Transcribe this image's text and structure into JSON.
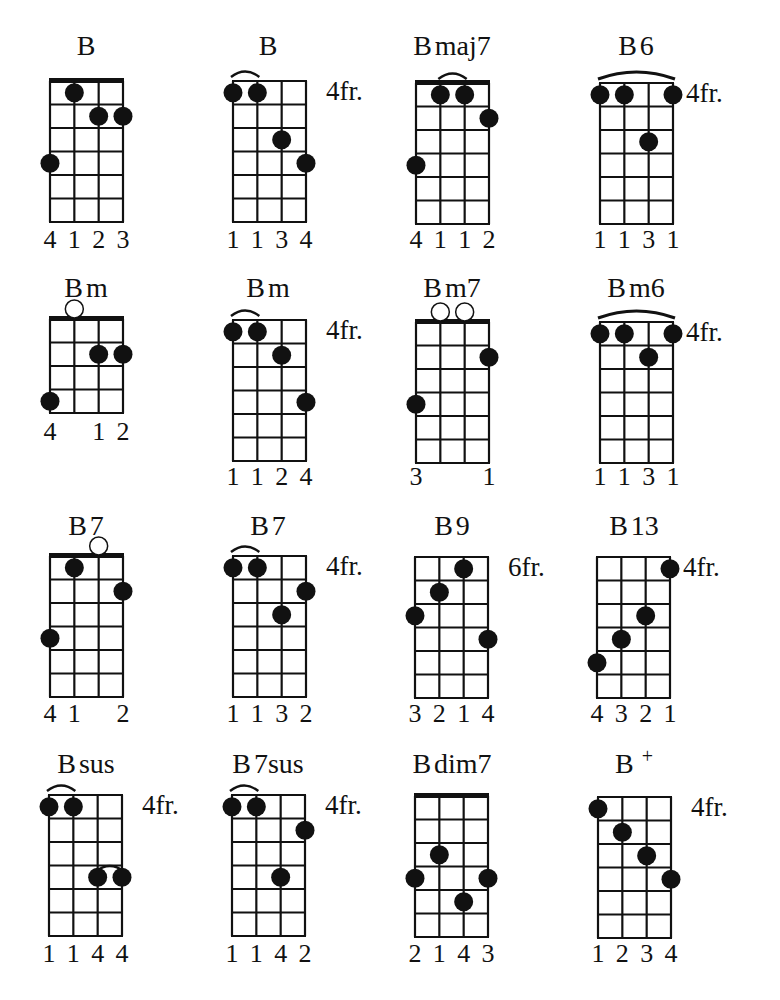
{
  "page": {
    "root": "B"
  },
  "style": {
    "ink": "#111111",
    "paper": "#ffffff"
  },
  "chords": [
    {
      "name": "B",
      "x": 50,
      "y": 81,
      "frets": 6,
      "nut": true,
      "position": "",
      "title_x": 86,
      "title_y": 55,
      "dots": [
        [
          1,
          1
        ],
        [
          2,
          2
        ],
        [
          3,
          2
        ],
        [
          0,
          4
        ]
      ],
      "open": [],
      "arcs": [],
      "fingers": [
        "4",
        "1",
        "2",
        "3"
      ],
      "fingers_y": 248
    },
    {
      "name": "B",
      "x": 233,
      "y": 81,
      "frets": 6,
      "nut": false,
      "position": "4fr.",
      "title_x": 268,
      "title_y": 55,
      "dots": [
        [
          0,
          1
        ],
        [
          1,
          1
        ],
        [
          2,
          3
        ],
        [
          3,
          4
        ]
      ],
      "open": [],
      "arcs": [
        [
          0,
          1
        ]
      ],
      "fingers": [
        "1",
        "1",
        "3",
        "4"
      ],
      "fingers_y": 248
    },
    {
      "name": "B maj7",
      "x": 416,
      "y": 83,
      "frets": 6,
      "nut": true,
      "position": "",
      "title_x": 452,
      "title_y": 55,
      "dots": [
        [
          1,
          1
        ],
        [
          2,
          1
        ],
        [
          3,
          2
        ],
        [
          0,
          4
        ]
      ],
      "open": [],
      "arcs": [
        [
          1,
          2
        ]
      ],
      "fingers": [
        "4",
        "1",
        "1",
        "2"
      ],
      "fingers_y": 248
    },
    {
      "name": "B 6",
      "x": 600,
      "y": 83,
      "frets": 6,
      "nut": false,
      "position": "4fr.",
      "title_x": 636,
      "title_y": 55,
      "dots": [
        [
          0,
          1
        ],
        [
          1,
          1
        ],
        [
          3,
          1
        ],
        [
          2,
          3
        ]
      ],
      "open": [],
      "arcs": [
        [
          0,
          3
        ]
      ],
      "fingers": [
        "1",
        "1",
        "3",
        "1"
      ],
      "fingers_y": 248
    },
    {
      "name": "B m",
      "x": 50,
      "y": 319,
      "frets": 4,
      "nut": true,
      "position": "",
      "title_x": 86,
      "title_y": 297,
      "dots": [
        [
          2,
          2
        ],
        [
          3,
          2
        ],
        [
          0,
          4
        ]
      ],
      "open": [
        1
      ],
      "arcs": [],
      "fingers": [
        "4",
        "",
        "1",
        "2"
      ],
      "fingers_y": 440
    },
    {
      "name": "B m",
      "x": 233,
      "y": 320,
      "frets": 6,
      "nut": false,
      "position": "4fr.",
      "title_x": 268,
      "title_y": 297,
      "dots": [
        [
          0,
          1
        ],
        [
          1,
          1
        ],
        [
          2,
          2
        ],
        [
          3,
          4
        ]
      ],
      "open": [],
      "arcs": [
        [
          0,
          1
        ]
      ],
      "fingers": [
        "1",
        "1",
        "2",
        "4"
      ],
      "fingers_y": 485
    },
    {
      "name": "B m7",
      "x": 416,
      "y": 322,
      "frets": 6,
      "nut": true,
      "position": "",
      "title_x": 452,
      "title_y": 297,
      "dots": [
        [
          3,
          2
        ],
        [
          0,
          4
        ]
      ],
      "open": [
        1,
        2
      ],
      "arcs": [],
      "fingers": [
        "3",
        "",
        "",
        "1"
      ],
      "fingers_y": 485
    },
    {
      "name": "B m6",
      "x": 600,
      "y": 322,
      "frets": 6,
      "nut": false,
      "position": "4fr.",
      "title_x": 636,
      "title_y": 297,
      "dots": [
        [
          0,
          1
        ],
        [
          1,
          1
        ],
        [
          3,
          1
        ],
        [
          2,
          2
        ]
      ],
      "open": [],
      "arcs": [
        [
          0,
          3
        ]
      ],
      "fingers": [
        "1",
        "1",
        "3",
        "1"
      ],
      "fingers_y": 485
    },
    {
      "name": "B 7",
      "x": 50,
      "y": 556,
      "frets": 6,
      "nut": true,
      "position": "",
      "title_x": 86,
      "title_y": 535,
      "dots": [
        [
          1,
          1
        ],
        [
          3,
          2
        ],
        [
          0,
          4
        ]
      ],
      "open": [
        2
      ],
      "arcs": [],
      "fingers": [
        "4",
        "1",
        "",
        "2"
      ],
      "fingers_y": 722
    },
    {
      "name": "B 7",
      "x": 233,
      "y": 556,
      "frets": 6,
      "nut": false,
      "position": "4fr.",
      "title_x": 268,
      "title_y": 535,
      "dots": [
        [
          0,
          1
        ],
        [
          1,
          1
        ],
        [
          3,
          2
        ],
        [
          2,
          3
        ]
      ],
      "open": [],
      "arcs": [
        [
          0,
          1
        ]
      ],
      "fingers": [
        "1",
        "1",
        "3",
        "2"
      ],
      "fingers_y": 722
    },
    {
      "name": "B 9",
      "x": 415,
      "y": 557,
      "frets": 6,
      "nut": false,
      "position": "6fr.",
      "title_x": 452,
      "title_y": 535,
      "dots": [
        [
          2,
          1
        ],
        [
          1,
          2
        ],
        [
          0,
          3
        ],
        [
          3,
          4
        ]
      ],
      "open": [],
      "arcs": [],
      "fingers": [
        "3",
        "2",
        "1",
        "4"
      ],
      "fingers_y": 722
    },
    {
      "name": "B 13",
      "x": 597,
      "y": 557,
      "frets": 6,
      "nut": false,
      "position": "4fr.",
      "title_x": 634,
      "title_y": 535,
      "dots": [
        [
          3,
          1
        ],
        [
          2,
          3
        ],
        [
          1,
          4
        ],
        [
          0,
          5
        ]
      ],
      "open": [],
      "arcs": [],
      "fingers": [
        "4",
        "3",
        "2",
        "1"
      ],
      "fingers_y": 722
    },
    {
      "name": "B sus",
      "x": 49,
      "y": 795,
      "frets": 6,
      "nut": false,
      "position": "4fr.",
      "title_x": 86,
      "title_y": 773,
      "dots": [
        [
          0,
          1
        ],
        [
          1,
          1
        ],
        [
          2,
          4
        ],
        [
          3,
          4
        ]
      ],
      "open": [],
      "arcs": [
        [
          0,
          1
        ],
        [
          2,
          3,
          4
        ]
      ],
      "fingers": [
        "1",
        "1",
        "4",
        "4"
      ],
      "fingers_y": 962
    },
    {
      "name": "B 7sus",
      "x": 232,
      "y": 795,
      "frets": 6,
      "nut": false,
      "position": "4fr.",
      "title_x": 268,
      "title_y": 773,
      "dots": [
        [
          0,
          1
        ],
        [
          1,
          1
        ],
        [
          3,
          2
        ],
        [
          2,
          4
        ]
      ],
      "open": [],
      "arcs": [
        [
          0,
          1
        ]
      ],
      "fingers": [
        "1",
        "1",
        "4",
        "2"
      ],
      "fingers_y": 962
    },
    {
      "name": "B dim7",
      "x": 415,
      "y": 796,
      "frets": 6,
      "nut": true,
      "position": "",
      "title_x": 452,
      "title_y": 773,
      "dots": [
        [
          1,
          3
        ],
        [
          0,
          4
        ],
        [
          3,
          4
        ],
        [
          2,
          5
        ]
      ],
      "open": [],
      "arcs": [],
      "fingers": [
        "2",
        "1",
        "4",
        "3"
      ],
      "fingers_y": 962
    },
    {
      "name": "B +",
      "x": 598,
      "y": 797,
      "frets": 6,
      "nut": false,
      "position": "4fr.",
      "title_x": 634,
      "title_y": 773,
      "dots": [
        [
          0,
          1
        ],
        [
          1,
          2
        ],
        [
          2,
          3
        ],
        [
          3,
          4
        ]
      ],
      "open": [],
      "arcs": [],
      "fingers": [
        "1",
        "2",
        "3",
        "4"
      ],
      "fingers_y": 962
    }
  ]
}
